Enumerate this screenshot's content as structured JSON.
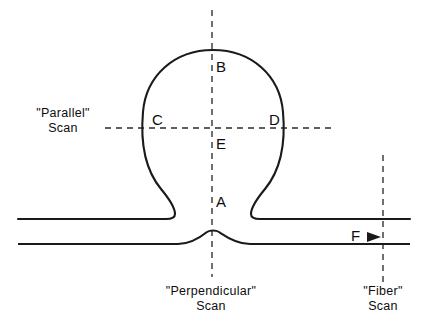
{
  "figure": {
    "background_color": "#ffffff",
    "line_color": "#1a1a1a",
    "axis_color": "#2b2b2b",
    "width": 422,
    "height": 331
  },
  "point_labels": [
    {
      "id": "A",
      "text": "A",
      "x": 216,
      "y": 203
    },
    {
      "id": "B",
      "text": "B",
      "x": 216,
      "y": 68
    },
    {
      "id": "C",
      "text": "C",
      "x": 152,
      "y": 121
    },
    {
      "id": "D",
      "text": "D",
      "x": 269,
      "y": 121
    },
    {
      "id": "E",
      "text": "E",
      "x": 216,
      "y": 145
    },
    {
      "id": "F",
      "text": "F",
      "x": 357,
      "y": 237
    }
  ],
  "scan_labels": {
    "parallel": {
      "line1": "\"Parallel\"",
      "line2": "Scan",
      "x": 63,
      "y": 117
    },
    "perpendicular": {
      "line1": "\"Perpendicular\"",
      "line2": "Scan",
      "x": 211,
      "y": 295
    },
    "fiber": {
      "line1": "\"Fiber\"",
      "line2": "Scan",
      "x": 383,
      "y": 295
    }
  },
  "scan_axes": [
    {
      "id": "perpendicular-axis",
      "orientation": "vertical",
      "x": 212,
      "y_start": 10,
      "y_end": 277
    },
    {
      "id": "parallel-axis",
      "orientation": "horizontal",
      "y": 128,
      "x_start": 105,
      "x_end": 332
    },
    {
      "id": "fiber-axis",
      "orientation": "vertical",
      "x": 383,
      "y_start": 155,
      "y_end": 282
    }
  ],
  "geometry": {
    "bead_center_x": 213,
    "bead_center_y": 120,
    "bead_radius": 70,
    "upper_fiber_y": 218,
    "lower_fiber_y": 243,
    "fiber_left_end": 18,
    "fiber_right_end": 410,
    "bead_top_y": 50
  }
}
